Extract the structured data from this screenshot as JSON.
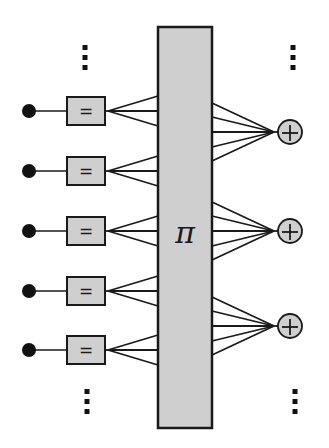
{
  "diagram": {
    "type": "network-architecture",
    "colors": {
      "stroke": "#1a1a1a",
      "fill_gray": "#cfcfcf",
      "node_black": "#111111",
      "background": "#ffffff"
    },
    "central_block": {
      "label": "π",
      "x": 158,
      "y": 27,
      "width": 54,
      "height": 401
    },
    "input_nodes": [
      {
        "y": 111,
        "op_label": "="
      },
      {
        "y": 171,
        "op_label": "="
      },
      {
        "y": 231,
        "op_label": "="
      },
      {
        "y": 291,
        "op_label": "="
      },
      {
        "y": 350,
        "op_label": "="
      }
    ],
    "input_geometry": {
      "dot_x": 29,
      "dot_r": 7,
      "box_x": 67,
      "box_w": 38,
      "box_h": 28,
      "fan_origin_x": 108,
      "fan_offsets": [
        -15,
        0,
        15
      ]
    },
    "sum_nodes": [
      {
        "y": 132,
        "label": "+"
      },
      {
        "y": 231,
        "label": "+"
      },
      {
        "y": 326,
        "label": "+"
      }
    ],
    "sum_geometry": {
      "cx": 290,
      "r": 12,
      "fan_target_x": 274,
      "fan_offsets": [
        -29,
        -15,
        0,
        15,
        29
      ]
    },
    "ellipses": [
      {
        "x": 85,
        "y": 48,
        "position": "top-left"
      },
      {
        "x": 293,
        "y": 48,
        "position": "top-right"
      },
      {
        "x": 87,
        "y": 392,
        "position": "bottom-left"
      },
      {
        "x": 295,
        "y": 392,
        "position": "bottom-right"
      }
    ]
  }
}
